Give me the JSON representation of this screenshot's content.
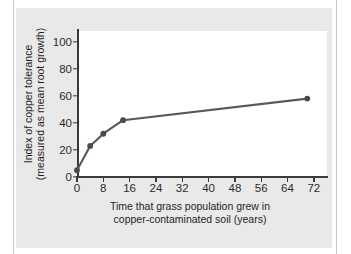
{
  "figure": {
    "background_color": "#e9e9e9",
    "plot_background_color": "#ffffff",
    "axis_color": "#3a3a3a"
  },
  "chart_data": {
    "type": "line",
    "title": "",
    "subtitle": "",
    "xlabel_line1": "Time that grass population grew in",
    "xlabel_line2": "copper-contaminated soil (years)",
    "ylabel_line1": "Index of copper tolerance",
    "ylabel_line2": "(measured as mean root growth)",
    "x": [
      0,
      4,
      8,
      14,
      70
    ],
    "values": [
      5,
      23,
      32,
      42,
      58
    ],
    "series": [
      {
        "name": "Index of copper tolerance",
        "x": [
          0,
          4,
          8,
          14,
          70
        ],
        "values": [
          5,
          23,
          32,
          42,
          58
        ],
        "color": "#585858",
        "marker": "circle",
        "marker_color": "#4a4a4a"
      }
    ],
    "xlim": [
      0,
      76
    ],
    "ylim": [
      0,
      108
    ],
    "xticks": [
      0,
      8,
      16,
      24,
      32,
      40,
      48,
      56,
      64,
      72
    ],
    "xtick_labels": [
      "0",
      "8",
      "16",
      "24",
      "32",
      "40",
      "48",
      "56",
      "64",
      "72"
    ],
    "yticks": [
      0,
      20,
      40,
      60,
      80,
      100
    ],
    "ytick_labels": [
      "0",
      "20",
      "40",
      "60",
      "80",
      "100"
    ],
    "grid": false,
    "legend": false,
    "legend_position": "none"
  }
}
